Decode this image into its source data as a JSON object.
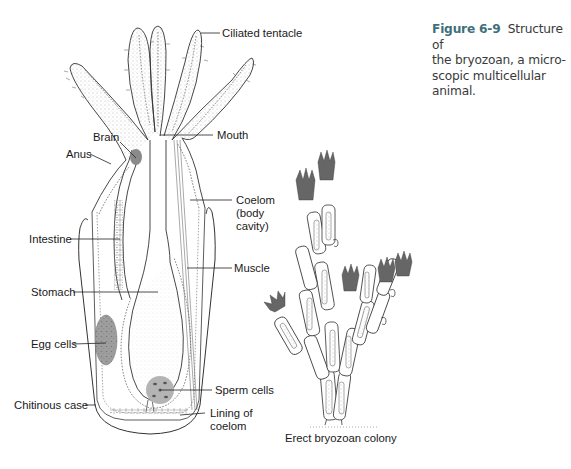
{
  "caption": {
    "figure_number": "Figure 6-9",
    "text": "Structure of the bryozoan, a microscopic multicellular animal.",
    "line1": "Structure of",
    "line2": "the bryozoan, a micro-",
    "line3": "scopic multicellular animal."
  },
  "labels": {
    "ciliated_tentacle": "Ciliated tentacle",
    "mouth": "Mouth",
    "brain": "Brain",
    "anus": "Anus",
    "coelom_1": "Coelom",
    "coelom_2": "(body",
    "coelom_3": "cavity)",
    "intestine": "Intestine",
    "muscle": "Muscle",
    "stomach": "Stomach",
    "egg_cells": "Egg cells",
    "sperm_cells": "Sperm cells",
    "chitinous_case": "Chitinous case",
    "lining_1": "Lining of",
    "lining_2": "coelom",
    "colony": "Erect bryozoan colony"
  },
  "colors": {
    "organ_fill": "#8a8a8a",
    "egg_fill": "#9a9a9a",
    "sperm_fill": "#b4b4b4",
    "line": "#333333",
    "caption_accent": "#3f6f7a"
  }
}
